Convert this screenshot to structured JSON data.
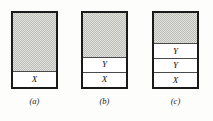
{
  "figure": {
    "background_color": "#fdfdfb",
    "outline_color": "#1a1a1a",
    "hatch_color": "#bdbdb7",
    "fill_color": "#ffffff",
    "panels": [
      {
        "caption": "(a)",
        "bands": [
          {
            "label": "",
            "style": "hatched",
            "height_fraction": 0.79
          },
          {
            "label": "X",
            "style": "plain",
            "height_fraction": 0.21
          }
        ]
      },
      {
        "caption": "(b)",
        "bands": [
          {
            "label": "",
            "style": "hatched",
            "height_fraction": 0.59
          },
          {
            "label": "Y",
            "style": "plain",
            "height_fraction": 0.205
          },
          {
            "label": "X",
            "style": "plain",
            "height_fraction": 0.205
          }
        ]
      },
      {
        "caption": "(c)",
        "bands": [
          {
            "label": "",
            "style": "hatched",
            "height_fraction": 0.41
          },
          {
            "label": "Y",
            "style": "plain",
            "height_fraction": 0.197
          },
          {
            "label": "Y",
            "style": "plain",
            "height_fraction": 0.197
          },
          {
            "label": "X",
            "style": "plain",
            "height_fraction": 0.196
          }
        ]
      }
    ]
  }
}
